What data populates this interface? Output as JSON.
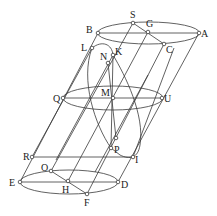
{
  "colors": {
    "stroke": "#3a3a3a",
    "label": "#222222",
    "background": "#ffffff"
  },
  "ellipses": [
    {
      "name": "top-ellipse",
      "cx": 148.5,
      "cy": 33,
      "rx": 51,
      "ry": 11
    },
    {
      "name": "middle-ellipse",
      "cx": 113,
      "cy": 98,
      "rx": 50,
      "ry": 12
    },
    {
      "name": "bottom-ellipse",
      "cx": 69,
      "cy": 182,
      "rx": 49,
      "ry": 12
    }
  ],
  "points": {
    "S": {
      "x": 133,
      "y": 23,
      "lx": 130,
      "ly": 18,
      "label": "S"
    },
    "G": {
      "x": 148,
      "y": 32,
      "lx": 146,
      "ly": 27,
      "label": "G"
    },
    "B": {
      "x": 98,
      "y": 33,
      "lx": 86,
      "ly": 33,
      "label": "B"
    },
    "A": {
      "x": 199,
      "y": 33,
      "lx": 201,
      "ly": 37,
      "label": "A"
    },
    "C": {
      "x": 164,
      "y": 44,
      "lx": 166,
      "ly": 53,
      "label": "C"
    },
    "L": {
      "x": 92,
      "y": 48,
      "lx": 81,
      "ly": 51,
      "label": "L"
    },
    "K": {
      "x": 113,
      "y": 55,
      "lx": 115,
      "ly": 55,
      "label": "K"
    },
    "N": {
      "x": 108,
      "y": 63,
      "lx": 100,
      "ly": 60,
      "label": "N"
    },
    "Q": {
      "x": 63,
      "y": 98,
      "lx": 53,
      "ly": 102,
      "label": "Q"
    },
    "M": {
      "x": 113,
      "y": 98,
      "lx": 101,
      "ly": 96,
      "label": "M"
    },
    "U": {
      "x": 162,
      "y": 98,
      "lx": 164,
      "ly": 102,
      "label": "U"
    },
    "P2": {
      "x": 116,
      "y": 138,
      "lx": 0,
      "ly": 0,
      "label": ""
    },
    "P": {
      "x": 111,
      "y": 148,
      "lx": 114,
      "ly": 153,
      "label": "P"
    },
    "R": {
      "x": 32,
      "y": 157,
      "lx": 23,
      "ly": 160,
      "label": "R"
    },
    "I": {
      "x": 133,
      "y": 157,
      "lx": 135,
      "ly": 163,
      "label": "I"
    },
    "O": {
      "x": 51,
      "y": 171,
      "lx": 41,
      "ly": 171,
      "label": "O"
    },
    "E": {
      "x": 20,
      "y": 182,
      "lx": 9,
      "ly": 186,
      "label": "E"
    },
    "H": {
      "x": 68,
      "y": 181,
      "lx": 62,
      "ly": 193,
      "label": "H"
    },
    "D": {
      "x": 118,
      "y": 182,
      "lx": 121,
      "ly": 188,
      "label": "D"
    },
    "F": {
      "x": 87,
      "y": 194,
      "lx": 84,
      "ly": 206,
      "label": "F"
    }
  },
  "segments": [
    [
      "B",
      "A"
    ],
    [
      "Q",
      "U"
    ],
    [
      "E",
      "D"
    ],
    [
      "R",
      "I"
    ],
    [
      "S",
      "C"
    ],
    [
      "O",
      "F"
    ],
    [
      "B",
      "E"
    ],
    [
      "A",
      "D"
    ],
    [
      "S",
      "O"
    ],
    [
      "G",
      "H"
    ],
    [
      "C",
      "F"
    ],
    [
      "K",
      "P"
    ],
    [
      "N",
      "P2"
    ]
  ],
  "extra_lines": [
    {
      "x1": 92,
      "y1": 48,
      "x2": 32,
      "y2": 157
    },
    {
      "x1": 113,
      "y1": 55,
      "x2": 56,
      "y2": 160
    },
    {
      "x1": 174,
      "y1": 48,
      "x2": 133,
      "y2": 157
    },
    {
      "x1": 148,
      "y1": 75,
      "x2": 95,
      "y2": 172
    }
  ],
  "section_curve": "M92,48 C102,40 112,44 113,55 C125,75 145,115 140,145 C138,158 130,160 120,155 L111,148 C95,125 80,80 92,48 Z"
}
